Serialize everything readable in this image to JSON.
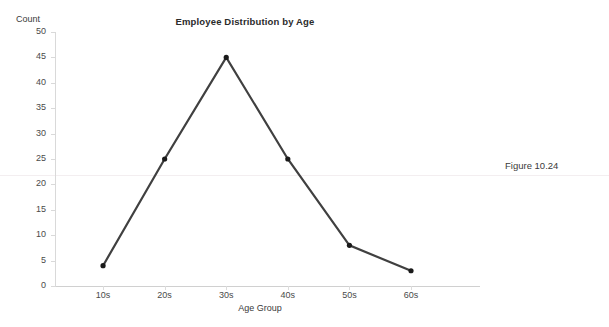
{
  "chart_data": {
    "type": "line",
    "title": "Employee Distribution by Age",
    "xlabel": "Age Group",
    "ylabel": "Count",
    "categories": [
      "10s",
      "20s",
      "30s",
      "40s",
      "50s",
      "60s"
    ],
    "values": [
      4,
      25,
      45,
      25,
      8,
      3
    ],
    "series": [
      {
        "name": "Count",
        "values": [
          4,
          25,
          45,
          25,
          8,
          3
        ]
      }
    ],
    "ylim": [
      0,
      50
    ],
    "ytick_step": 5,
    "yticks": [
      0,
      5,
      10,
      15,
      20,
      25,
      30,
      35,
      40,
      45,
      50
    ],
    "ytick_labels": [
      "0",
      "5",
      "10",
      "15",
      "20",
      "25",
      "30",
      "35",
      "40",
      "45",
      "50"
    ],
    "grid": false,
    "legend": false,
    "line_color": "#404040",
    "marker_color": "#1a1a1a",
    "axis_color": "#d9d9d9",
    "text_color": "#3a3a3a"
  },
  "annotations": {
    "figure_caption": "Figure 10.24"
  }
}
